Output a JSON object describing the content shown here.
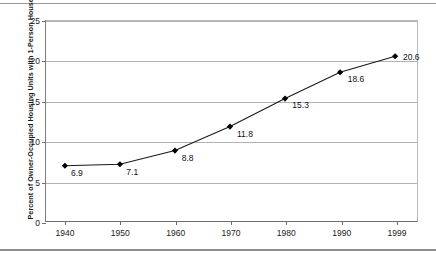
{
  "chart_data": {
    "type": "line",
    "title": "",
    "xlabel": "",
    "ylabel": "Percent of Owner-Occupied Housing Units with 1-Person Households",
    "categories": [
      "1940",
      "1950",
      "1960",
      "1970",
      "1980",
      "1990",
      "1999"
    ],
    "x": [
      1940,
      1950,
      1960,
      1970,
      1980,
      1990,
      1999
    ],
    "values": [
      6.9,
      7.1,
      8.8,
      11.8,
      15.3,
      18.6,
      20.6
    ],
    "point_labels": [
      "6.9",
      "7.1",
      "8.8",
      "11.8",
      "15.3",
      "18.6",
      "20.6"
    ],
    "ylim": [
      0,
      25
    ],
    "yticks": [
      0,
      5,
      10,
      15,
      20,
      25
    ],
    "ytick_labels": [
      "0",
      "5",
      "10",
      "15",
      "20",
      "25"
    ],
    "grid": "horizontal",
    "legend": "none",
    "marker": "diamond",
    "series": [
      {
        "name": "Percent of Owner-Occupied Housing Units with 1-Person Households",
        "values": [
          6.9,
          7.1,
          8.8,
          11.8,
          15.3,
          18.6,
          20.6
        ]
      }
    ]
  },
  "colors": {
    "line": "#1a1a1a",
    "marker": "#000000",
    "gridline": "#b2b2b2",
    "axis": "#6f6f6f",
    "text": "#1a1a1a",
    "background": "#ffffff"
  }
}
